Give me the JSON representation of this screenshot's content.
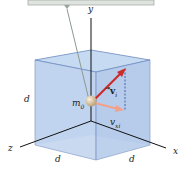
{
  "diagram": {
    "labels": {
      "axis_x": "x",
      "axis_y": "y",
      "axis_z": "z",
      "mass": "m",
      "mass_sub": "0",
      "velocity_vector": "v",
      "velocity_sub": "i",
      "velocity_x": "v",
      "velocity_x_sub": "xi",
      "side_left": "d",
      "side_bottom_left": "d",
      "side_bottom_right": "d"
    },
    "colors": {
      "ceiling": "#dfe3df",
      "cube_face": "#bcd2ee",
      "cube_edge": "#6e8cc0",
      "velocity_arrow": "#cc2a2a",
      "velocity_x_arrow": "#f2a08a",
      "mass_ball": "#d9c4a0"
    }
  }
}
